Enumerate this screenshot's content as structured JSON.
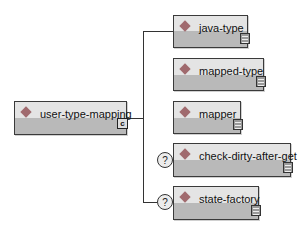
{
  "root": {
    "label": "user-type-mapping",
    "connector_icon": "sequence-connector-icon",
    "connector_glyph": "c"
  },
  "children": [
    {
      "label": "java-type",
      "optional": false
    },
    {
      "label": "mapped-type",
      "optional": false
    },
    {
      "label": "mapper",
      "optional": false
    },
    {
      "label": "check-dirty-after-get",
      "optional": true
    },
    {
      "label": "state-factory",
      "optional": true
    }
  ],
  "optional_glyph": "?",
  "colors": {
    "diamond": "#a06a6e",
    "box_top": "#e4e4e4",
    "box_bottom": "#b9b9b9",
    "border": "#3a3a3a"
  }
}
